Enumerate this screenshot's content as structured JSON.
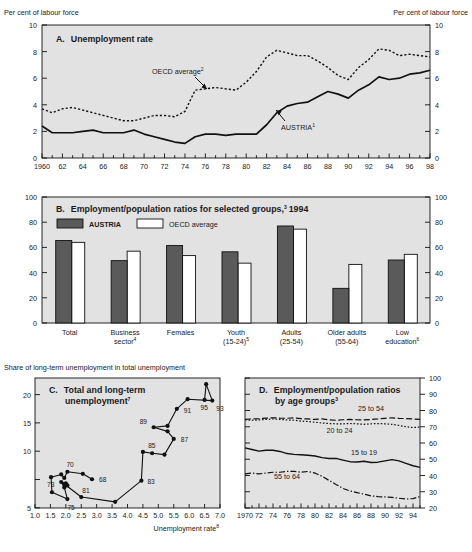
{
  "figure": {
    "header_left": "Per cent of labour force",
    "header_right": "Per cent of labour force",
    "panelC_header": "Share of long-term unemployment in total unemployment"
  },
  "chart_data": [
    {
      "type": "line",
      "panel": "A",
      "title": "A.  Unemployment rate",
      "title_letter": "A.",
      "title_text": "Unemployment rate",
      "ylabel": "Per cent of labour force",
      "xlabel": "",
      "ylim": [
        0,
        10
      ],
      "yticks": [
        0,
        2,
        4,
        6,
        8,
        10
      ],
      "xlim": [
        1960,
        1998
      ],
      "xticks": [
        1960,
        1962,
        1964,
        1966,
        1968,
        1970,
        1972,
        1974,
        1976,
        1978,
        1980,
        1982,
        1984,
        1986,
        1988,
        1990,
        1992,
        1994,
        1996,
        1998
      ],
      "xticklabels": [
        "1960",
        "62",
        "64",
        "66",
        "68",
        "70",
        "72",
        "74",
        "76",
        "78",
        "80",
        "82",
        "84",
        "86",
        "88",
        "90",
        "92",
        "94",
        "96",
        "98"
      ],
      "grid": false,
      "annotations": [
        {
          "text": "OECD average",
          "sup": "2",
          "x": 1973.0,
          "y": 6.6
        },
        {
          "text": "AUSTRIA",
          "sup": "1",
          "x": 1985.5,
          "y": 3.0
        }
      ],
      "x": [
        1960,
        1961,
        1962,
        1963,
        1964,
        1965,
        1966,
        1967,
        1968,
        1969,
        1970,
        1971,
        1972,
        1973,
        1974,
        1975,
        1976,
        1977,
        1978,
        1979,
        1980,
        1981,
        1982,
        1983,
        1984,
        1985,
        1986,
        1987,
        1988,
        1989,
        1990,
        1991,
        1992,
        1993,
        1994,
        1995,
        1996,
        1997,
        1998
      ],
      "series": [
        {
          "name": "AUSTRIA",
          "style": "solid",
          "values": [
            2.4,
            1.9,
            1.9,
            1.9,
            2.0,
            2.1,
            1.9,
            1.9,
            1.9,
            2.1,
            1.8,
            1.6,
            1.4,
            1.2,
            1.1,
            1.6,
            1.8,
            1.8,
            1.7,
            1.8,
            1.8,
            1.8,
            2.5,
            3.4,
            3.9,
            4.1,
            4.2,
            4.6,
            5.0,
            4.8,
            4.5,
            5.1,
            5.5,
            6.1,
            5.9,
            6.0,
            6.3,
            6.4,
            6.6
          ]
        },
        {
          "name": "OECD average",
          "style": "dashed",
          "values": [
            3.7,
            3.4,
            3.7,
            3.8,
            3.6,
            3.4,
            3.2,
            3.0,
            2.8,
            2.8,
            3.0,
            3.2,
            3.2,
            3.1,
            3.5,
            5.1,
            5.2,
            5.3,
            5.2,
            5.1,
            5.7,
            6.5,
            7.6,
            8.1,
            7.9,
            7.7,
            7.7,
            7.3,
            6.8,
            6.2,
            5.9,
            6.8,
            7.4,
            8.2,
            8.1,
            7.7,
            7.8,
            7.7,
            7.6
          ]
        }
      ]
    },
    {
      "type": "bar",
      "panel": "B",
      "title": "B.  Employment/population ratios for selected groups, 1994",
      "title_letter": "B.",
      "title_text": "Employment/population ratios for selected groups,",
      "title_sup": "3",
      "title_year": "1994",
      "ylim": [
        0,
        100
      ],
      "yticks": [
        0,
        20,
        40,
        60,
        80,
        100
      ],
      "categories": [
        "Total",
        "Business sector",
        "Females",
        "Youth (15-24)",
        "Adults (25-54)",
        "Older adults (55-64)",
        "Low education"
      ],
      "category_lines": [
        [
          "Total",
          ""
        ],
        [
          "Business",
          "sector"
        ],
        [
          "Females",
          ""
        ],
        [
          "Youth",
          "(15-24)"
        ],
        [
          "Adults",
          "(25-54)"
        ],
        [
          "Older adults",
          "(55-64)"
        ],
        [
          "Low",
          "education"
        ]
      ],
      "category_sups": [
        "",
        "4",
        "",
        "5",
        "",
        "",
        "6"
      ],
      "series": [
        {
          "name": "AUSTRIA",
          "values": [
            65.5,
            49.5,
            61.5,
            56.5,
            77.0,
            27.5,
            50.0
          ],
          "fill": "#5a5a5a"
        },
        {
          "name": "OECD average",
          "values": [
            64.0,
            57.0,
            53.5,
            47.5,
            74.5,
            46.5,
            54.5
          ],
          "fill": "#ffffff"
        }
      ],
      "legend": [
        "AUSTRIA",
        "OECD average"
      ],
      "legend_position": "top-left"
    },
    {
      "type": "scatter",
      "panel": "C",
      "title": "C.  Total and long-term unemployment",
      "title_letter": "C.",
      "title_line1": "Total and long-term",
      "title_line2": "unemployment",
      "title_sup": "7",
      "xlabel": "Unemployment rate",
      "xlabel_sup": "8",
      "ylabel": "Share of long-term unemployment in total unemployment",
      "xlim": [
        1.0,
        7.0
      ],
      "ylim": [
        5,
        24
      ],
      "xticks": [
        1.0,
        1.5,
        2.0,
        2.5,
        3.0,
        3.5,
        4.0,
        4.5,
        5.0,
        5.5,
        6.0,
        6.5,
        7.0
      ],
      "xticklabels": [
        "1.0",
        "1.5",
        "2.0",
        "2.5",
        "3.0",
        "3.5",
        "4.0",
        "4.5",
        "5.0",
        "5.5",
        "6.0",
        "6.5",
        "7.0"
      ],
      "yticks": [
        5,
        10,
        15,
        20
      ],
      "connected": true,
      "points": [
        {
          "year": "68",
          "x": 2.85,
          "y": 9.2,
          "label": "68"
        },
        {
          "year": "69",
          "x": 2.55,
          "y": 10.0,
          "label": ""
        },
        {
          "year": "70",
          "x": 2.05,
          "y": 10.3,
          "label": "70"
        },
        {
          "year": "71",
          "x": 1.95,
          "y": 9.4,
          "label": ""
        },
        {
          "year": "72",
          "x": 1.85,
          "y": 9.9,
          "label": ""
        },
        {
          "year": "73",
          "x": 1.52,
          "y": 9.5,
          "label": "73"
        },
        {
          "year": "74",
          "x": 1.55,
          "y": 7.3,
          "label": ""
        },
        {
          "year": "75",
          "x": 2.05,
          "y": 6.3,
          "label": "75"
        },
        {
          "year": "76",
          "x": 1.95,
          "y": 8.0,
          "label": ""
        },
        {
          "year": "77",
          "x": 1.85,
          "y": 8.8,
          "label": ""
        },
        {
          "year": "78",
          "x": 2.0,
          "y": 8.6,
          "label": ""
        },
        {
          "year": "79",
          "x": 2.05,
          "y": 8.3,
          "label": ""
        },
        {
          "year": "80",
          "x": 1.95,
          "y": 8.5,
          "label": ""
        },
        {
          "year": "81",
          "x": 2.5,
          "y": 6.6,
          "label": "81"
        },
        {
          "year": "82",
          "x": 3.6,
          "y": 5.9,
          "label": ""
        },
        {
          "year": "83",
          "x": 4.45,
          "y": 9.0,
          "label": "83"
        },
        {
          "year": "84",
          "x": 4.5,
          "y": 13.2,
          "label": ""
        },
        {
          "year": "85",
          "x": 4.8,
          "y": 13.0,
          "label": "85"
        },
        {
          "year": "86",
          "x": 5.2,
          "y": 12.8,
          "label": ""
        },
        {
          "year": "87",
          "x": 5.5,
          "y": 15.1,
          "label": "87"
        },
        {
          "year": "88",
          "x": 5.3,
          "y": 16.2,
          "label": ""
        },
        {
          "year": "89",
          "x": 4.85,
          "y": 16.8,
          "label": "89"
        },
        {
          "year": "90",
          "x": 5.3,
          "y": 17.0,
          "label": ""
        },
        {
          "year": "91",
          "x": 5.6,
          "y": 19.5,
          "label": "91"
        },
        {
          "year": "92",
          "x": 5.95,
          "y": 20.9,
          "label": ""
        },
        {
          "year": "93",
          "x": 6.75,
          "y": 20.7,
          "label": "93"
        },
        {
          "year": "94",
          "x": 6.55,
          "y": 23.1,
          "label": ""
        },
        {
          "year": "95",
          "x": 6.5,
          "y": 20.8,
          "label": "95"
        }
      ]
    },
    {
      "type": "line",
      "panel": "D",
      "title": "D.  Employment/population ratios by age groups",
      "title_letter": "D.",
      "title_line1": "Employment/population ratios",
      "title_line2": "by age groups",
      "title_sup": "3",
      "ylim": [
        20,
        100
      ],
      "yticks": [
        20,
        30,
        40,
        50,
        60,
        70,
        80,
        90,
        100
      ],
      "xlim": [
        1970,
        1995
      ],
      "xticks": [
        1970,
        1972,
        1974,
        1976,
        1978,
        1980,
        1982,
        1984,
        1986,
        1988,
        1990,
        1992,
        1994
      ],
      "xticklabels": [
        "1970",
        "72",
        "74",
        "76",
        "78",
        "80",
        "82",
        "84",
        "86",
        "88",
        "90",
        "92",
        "94"
      ],
      "x": [
        1970,
        1971,
        1972,
        1973,
        1974,
        1975,
        1976,
        1977,
        1978,
        1979,
        1980,
        1981,
        1982,
        1983,
        1984,
        1985,
        1986,
        1987,
        1988,
        1989,
        1990,
        1991,
        1992,
        1993,
        1994,
        1995
      ],
      "series": [
        {
          "name": "25 to 54",
          "style": "dashdash",
          "values": [
            74.5,
            74.8,
            75.0,
            75.3,
            75.5,
            75.3,
            75.2,
            75.5,
            75.0,
            74.8,
            74.5,
            74.8,
            74.3,
            74.0,
            74.3,
            74.5,
            74.3,
            74.2,
            74.5,
            74.8,
            75.2,
            75.5,
            75.2,
            75.0,
            74.8,
            74.5
          ]
        },
        {
          "name": "20 to 24",
          "style": "dotted",
          "values": [
            74.3,
            74.0,
            74.2,
            74.5,
            74.8,
            74.5,
            74.2,
            74.0,
            73.5,
            73.2,
            72.8,
            72.3,
            72.0,
            71.8,
            71.8,
            72.0,
            71.8,
            71.5,
            71.8,
            72.0,
            71.8,
            71.5,
            70.8,
            70.0,
            69.5,
            69.8
          ]
        },
        {
          "name": "15 to 19",
          "style": "solid",
          "values": [
            57.0,
            56.0,
            55.0,
            55.5,
            55.5,
            54.8,
            53.5,
            53.0,
            52.8,
            52.5,
            52.0,
            51.0,
            50.5,
            50.5,
            49.5,
            48.5,
            48.3,
            48.8,
            48.0,
            48.2,
            49.0,
            49.8,
            49.0,
            47.5,
            46.0,
            45.0
          ]
        },
        {
          "name": "55 to 64",
          "style": "dashdot",
          "values": [
            41.0,
            41.5,
            41.0,
            41.5,
            42.0,
            42.0,
            42.5,
            42.5,
            42.0,
            42.5,
            41.5,
            39.5,
            37.0,
            34.5,
            32.0,
            30.5,
            29.5,
            28.5,
            27.5,
            27.0,
            26.8,
            26.5,
            26.0,
            25.5,
            25.8,
            27.0
          ]
        }
      ],
      "annotations": [
        {
          "text": "25 to 54",
          "x": 1988.0,
          "y": 80.0
        },
        {
          "text": "20 to 24",
          "x": 1983.5,
          "y": 66.0
        },
        {
          "text": "15 to 19",
          "x": 1987.0,
          "y": 52.5
        },
        {
          "text": "55 to 64",
          "x": 1976.0,
          "y": 38.0
        }
      ]
    }
  ]
}
